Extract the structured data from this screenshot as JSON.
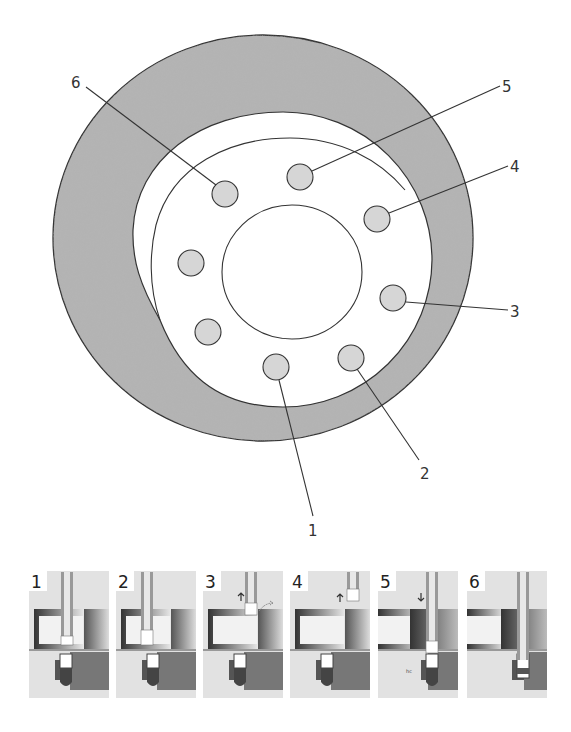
{
  "diagram": {
    "title": "",
    "colors": {
      "ring_fill": "#a9a9a9",
      "outline": "#333333",
      "hole_fill": "#d6d6d6",
      "background": "#ffffff"
    },
    "callouts": [
      {
        "id": "1",
        "label": "1"
      },
      {
        "id": "2",
        "label": "2"
      },
      {
        "id": "3",
        "label": "3"
      },
      {
        "id": "4",
        "label": "4"
      },
      {
        "id": "5",
        "label": "5"
      },
      {
        "id": "6",
        "label": "6"
      }
    ],
    "holes_count": 8
  },
  "panels": [
    {
      "step": "1",
      "arrow": "",
      "note": ""
    },
    {
      "step": "2",
      "arrow": "",
      "note": ""
    },
    {
      "step": "3",
      "arrow": "up",
      "note": ""
    },
    {
      "step": "4",
      "arrow": "up",
      "note": ""
    },
    {
      "step": "5",
      "arrow": "down",
      "note": "hc"
    },
    {
      "step": "6",
      "arrow": "",
      "note": ""
    }
  ]
}
